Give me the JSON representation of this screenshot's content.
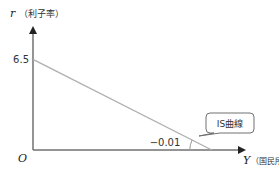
{
  "chart_data": {
    "type": "line",
    "title": "",
    "ylabel_var": "r",
    "ylabel_text": "（利子率）",
    "xlabel_var": "Y",
    "xlabel_text": "（国民所得）",
    "origin_label": "O",
    "y_intercept_label": "6.5",
    "slope_label": "−0.01",
    "series": [
      {
        "name": "IS曲線",
        "description": "downward-sloping line from y-intercept 6.5 to the x-axis",
        "y_intercept": 6.5,
        "slope": -0.01,
        "points": [
          [
            0,
            6.5
          ],
          [
            650,
            0
          ]
        ]
      }
    ],
    "xlim": [
      0,
      760
    ],
    "ylim": [
      0,
      8.6
    ],
    "grid": false,
    "colors": {
      "axis": "#707070",
      "line": "#b0b0b0",
      "text": "#333333"
    }
  },
  "callout": {
    "label": "IS曲線"
  }
}
